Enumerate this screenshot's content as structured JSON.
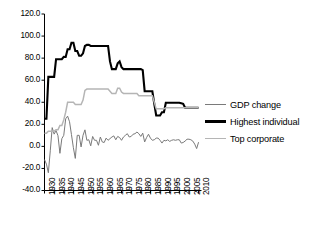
{
  "chart_data": {
    "type": "line",
    "title": "",
    "xlabel": "",
    "ylabel": "",
    "xlim": [
      1930,
      2011
    ],
    "ylim": [
      -40.0,
      120.0
    ],
    "grid": false,
    "legend_position": "right",
    "ytick_labels": [
      "120.0",
      "100.0",
      "80.0",
      "60.0",
      "40.0",
      "20.0",
      "0.0",
      "-20.0",
      "-40.0"
    ],
    "ytick_values": [
      120.0,
      100.0,
      80.0,
      60.0,
      40.0,
      20.0,
      0.0,
      -20.0,
      -40.0
    ],
    "xtick_labels": [
      "1930",
      "1935",
      "1940",
      "1945",
      "1950",
      "1955",
      "1960",
      "1965",
      "1970",
      "1975",
      "1980",
      "1985",
      "1990",
      "1995",
      "2000",
      "2005",
      "2010"
    ],
    "xtick_values": [
      1930,
      1935,
      1940,
      1945,
      1950,
      1955,
      1960,
      1965,
      1970,
      1975,
      1980,
      1985,
      1990,
      1995,
      2000,
      2005,
      2010
    ],
    "x": [
      1930,
      1931,
      1932,
      1933,
      1934,
      1935,
      1936,
      1937,
      1938,
      1939,
      1940,
      1941,
      1942,
      1943,
      1944,
      1945,
      1946,
      1947,
      1948,
      1949,
      1950,
      1951,
      1952,
      1953,
      1954,
      1955,
      1956,
      1957,
      1958,
      1959,
      1960,
      1961,
      1962,
      1963,
      1964,
      1965,
      1966,
      1967,
      1968,
      1969,
      1970,
      1971,
      1972,
      1973,
      1974,
      1975,
      1976,
      1977,
      1978,
      1979,
      1980,
      1981,
      1982,
      1983,
      1984,
      1985,
      1986,
      1987,
      1988,
      1989,
      1990,
      1991,
      1992,
      1993,
      1994,
      1995,
      1996,
      1997,
      1998,
      1999,
      2000,
      2001,
      2002,
      2003,
      2004,
      2005,
      2006,
      2007,
      2008,
      2009,
      2010
    ],
    "series": [
      {
        "name": "GDP change",
        "color": "#7a7a7a",
        "width": 1.0,
        "values": [
          -12.0,
          -16.1,
          -23.9,
          -4.0,
          17.0,
          11.1,
          14.3,
          9.7,
          -6.3,
          7.0,
          10.0,
          25.0,
          27.4,
          22.3,
          10.7,
          -1.2,
          -10.9,
          10.0,
          10.0,
          -0.5,
          10.0,
          15.0,
          5.5,
          6.0,
          0.5,
          9.0,
          5.5,
          5.5,
          1.0,
          8.5,
          4.0,
          3.5,
          7.5,
          5.5,
          7.0,
          8.5,
          9.5,
          6.0,
          9.0,
          8.0,
          5.5,
          8.5,
          10.0,
          11.5,
          8.5,
          9.0,
          11.0,
          11.5,
          13.0,
          11.5,
          9.0,
          12.0,
          4.0,
          8.0,
          11.0,
          7.5,
          5.5,
          6.0,
          7.5,
          7.5,
          5.5,
          3.0,
          5.5,
          5.0,
          6.0,
          4.5,
          5.5,
          6.0,
          5.5,
          6.0,
          6.0,
          3.0,
          3.5,
          4.8,
          6.5,
          6.5,
          6.0,
          4.8,
          2.0,
          -2.0,
          3.8
        ]
      },
      {
        "name": "Highest individual",
        "color": "#000000",
        "width": 2.1,
        "values": [
          25.0,
          25.0,
          63.0,
          63.0,
          63.0,
          63.0,
          79.0,
          79.0,
          79.0,
          79.0,
          81.1,
          81.0,
          88.0,
          88.0,
          94.0,
          94.0,
          86.4,
          86.4,
          82.1,
          82.1,
          84.4,
          91.0,
          92.0,
          92.0,
          91.0,
          91.0,
          91.0,
          91.0,
          91.0,
          91.0,
          91.0,
          91.0,
          91.0,
          91.0,
          77.0,
          70.0,
          70.0,
          70.0,
          75.3,
          77.0,
          71.8,
          70.0,
          70.0,
          70.0,
          70.0,
          70.0,
          70.0,
          70.0,
          70.0,
          70.0,
          70.0,
          69.1,
          50.0,
          50.0,
          50.0,
          50.0,
          50.0,
          38.5,
          28.0,
          28.0,
          28.0,
          31.0,
          31.0,
          39.6,
          39.6,
          39.6,
          39.6,
          39.6,
          39.6,
          39.6,
          39.6,
          39.1,
          38.6,
          35.0,
          35.0,
          35.0,
          35.0,
          35.0,
          35.0,
          35.0,
          35.0
        ]
      },
      {
        "name": "Top corporate",
        "color": "#b5b5b5",
        "width": 1.5,
        "values": [
          12.0,
          12.0,
          13.8,
          13.8,
          13.8,
          13.8,
          15.0,
          15.0,
          19.0,
          19.0,
          24.0,
          31.0,
          40.0,
          40.0,
          40.0,
          40.0,
          38.0,
          38.0,
          38.0,
          38.0,
          42.0,
          50.8,
          52.0,
          52.0,
          52.0,
          52.0,
          52.0,
          52.0,
          52.0,
          52.0,
          52.0,
          52.0,
          52.0,
          52.0,
          50.0,
          48.0,
          48.0,
          48.0,
          52.8,
          52.8,
          49.2,
          48.0,
          48.0,
          48.0,
          48.0,
          48.0,
          48.0,
          48.0,
          48.0,
          46.0,
          46.0,
          46.0,
          46.0,
          46.0,
          46.0,
          46.0,
          46.0,
          40.0,
          34.0,
          34.0,
          34.0,
          34.0,
          34.0,
          35.0,
          35.0,
          35.0,
          35.0,
          35.0,
          35.0,
          35.0,
          35.0,
          35.0,
          35.0,
          35.0,
          35.0,
          35.0,
          35.0,
          35.0,
          35.0,
          35.0,
          35.0
        ]
      }
    ]
  },
  "legend": {
    "items": [
      {
        "label": "GDP change",
        "color": "#7a7a7a",
        "width": 1.2
      },
      {
        "label": "Highest individual",
        "color": "#000000",
        "width": 3.0
      },
      {
        "label": "Top corporate",
        "color": "#b5b5b5",
        "width": 1.6
      }
    ]
  },
  "caption": {
    "text": ""
  }
}
